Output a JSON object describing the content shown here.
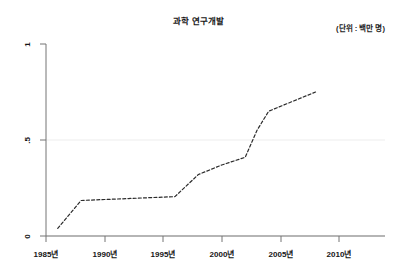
{
  "chart_data": {
    "type": "line",
    "title": "과학 연구개발",
    "annotation": "(단위 : 백만 명)",
    "xlabel": "",
    "ylabel": "",
    "grid": true,
    "legend": null,
    "xlim": [
      1985,
      2010
    ],
    "ylim": [
      0,
      1
    ],
    "x_ticks": [
      {
        "value": 1985,
        "label": "1985년"
      },
      {
        "value": 1990,
        "label": "1990년"
      },
      {
        "value": 1995,
        "label": "1995년"
      },
      {
        "value": 2000,
        "label": "2000년"
      },
      {
        "value": 2005,
        "label": "2005년"
      },
      {
        "value": 2010,
        "label": "2010년"
      }
    ],
    "y_ticks": [
      {
        "value": 0,
        "label": "0"
      },
      {
        "value": 0.5,
        "label": ".5"
      },
      {
        "value": 1,
        "label": "1"
      }
    ],
    "series": [
      {
        "name": "과학 연구개발",
        "style": "dashed",
        "color": "#2b2b2b",
        "x": [
          1986,
          1988,
          1990,
          1992,
          1994,
          1996,
          1998,
          2000,
          2002,
          2003,
          2004,
          2006,
          2008
        ],
        "values": [
          0.04,
          0.185,
          0.19,
          0.195,
          0.2,
          0.205,
          0.32,
          0.37,
          0.41,
          0.55,
          0.65,
          0.7,
          0.75
        ]
      }
    ]
  },
  "axes": {
    "axis_color": "#6b6b6b",
    "gridline_color": "#ececec",
    "tick_color": "#6b6b6b"
  }
}
